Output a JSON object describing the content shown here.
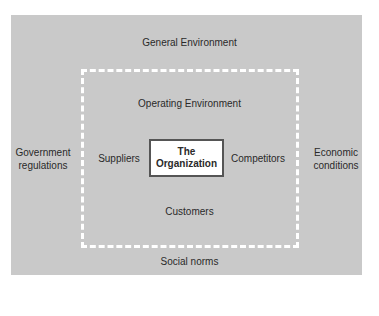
{
  "diagram": {
    "outer": {
      "label": "General Environment",
      "bottom_label": "Social norms",
      "left_label": [
        "Government",
        "regulations"
      ],
      "right_label": [
        "Economic",
        "conditions"
      ],
      "color": "#c9c9c9"
    },
    "inner": {
      "label": "Operating Environment",
      "left_label": "Suppliers",
      "right_label": "Competitors",
      "bottom_label": "Customers",
      "border_color": "#ffffff"
    },
    "center": {
      "lines": [
        "The",
        "Organization"
      ]
    }
  }
}
